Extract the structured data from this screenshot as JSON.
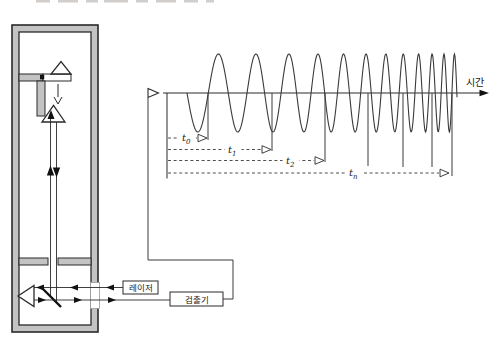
{
  "diagram": {
    "labels": {
      "laser": "레이저",
      "detector": "검출기",
      "time_axis": "시간"
    },
    "colors": {
      "line": "#2a2a2a",
      "wall_gray": "#c3c3c3",
      "wave": "#3a3a3a"
    },
    "chart_data": {
      "type": "line",
      "title": "",
      "description": "Detector output: chirp waveform whose frequency increases with time; cumulative intervals t0, t1, t2, ..., tn marked from origin to successive wave boundaries",
      "xlabel": "시간",
      "legend": "none",
      "grid": false,
      "axis": {
        "x_start": 163,
        "x_end": 489,
        "y": 93
      },
      "wave": {
        "x_start": 187,
        "x_end": 457,
        "amplitude": 39,
        "period_start_px": 44,
        "period_end_px": 9.5
      },
      "origin_tick": {
        "x": 167,
        "y_top": 93,
        "y_bottom": 178.5
      },
      "boundaries": [
        {
          "x": 208,
          "y_bottom": 140
        },
        {
          "x": 272,
          "y_bottom": 151
        },
        {
          "x": 325,
          "y_bottom": 162
        },
        {
          "x": 368,
          "y_bottom": 166
        },
        {
          "x": 403,
          "y_bottom": 167
        },
        {
          "x": 432,
          "y_bottom": 167
        },
        {
          "x": 452,
          "y_bottom": 176
        }
      ],
      "intervals": [
        {
          "base": "t",
          "sub": "0",
          "y": 138,
          "x_start": 168,
          "x_end": 207,
          "label_x": 187
        },
        {
          "base": "t",
          "sub": "1",
          "y": 149.5,
          "x_start": 168,
          "x_end": 271,
          "label_x": 233
        },
        {
          "base": "t",
          "sub": "2",
          "y": 160.5,
          "x_start": 168,
          "x_end": 324,
          "label_x": 291
        },
        {
          "base": "t",
          "sub": "n",
          "y": 173,
          "x_start": 168,
          "x_end": 449,
          "label_x": 354
        }
      ]
    }
  }
}
